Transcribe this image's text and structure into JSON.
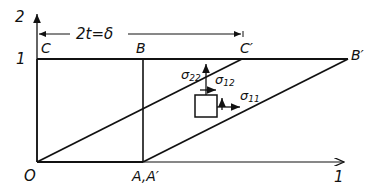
{
  "diagram": {
    "axes": {
      "x_label": "1",
      "y_label": "2",
      "y_tick_label": "1"
    },
    "dimension": {
      "label": "2t=δ"
    },
    "points": {
      "O": "O",
      "A": "A,A′",
      "B": "B",
      "C": "C",
      "B_prime": "B′",
      "C_prime": "C′"
    },
    "stresses": {
      "s22": "σ",
      "s22_sub": "22",
      "s12": "σ",
      "s12_sub": "12",
      "s11": "σ",
      "s11_sub": "11"
    },
    "colors": {
      "ink": "#111111",
      "background": "#ffffff"
    }
  }
}
